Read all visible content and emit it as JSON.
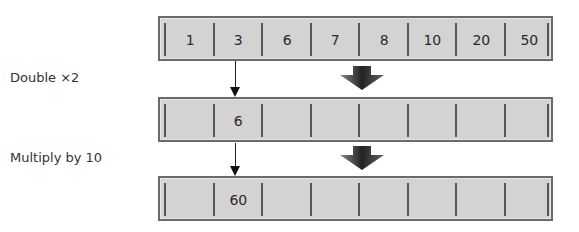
{
  "diagram": {
    "rows": [
      {
        "label": "",
        "cells": [
          "1",
          "3",
          "6",
          "7",
          "8",
          "10",
          "20",
          "50"
        ]
      },
      {
        "label": "Double ×2",
        "cells": [
          "",
          "6",
          "",
          "",
          "",
          "",
          "",
          ""
        ]
      },
      {
        "label": "Multiply by 10",
        "cells": [
          "",
          "60",
          "",
          "",
          "",
          "",
          "",
          ""
        ]
      }
    ],
    "steps": [
      {
        "label": "Double ×2",
        "from_cell_index": 1,
        "result": "6"
      },
      {
        "label": "Multiply by 10",
        "from_cell_index": 1,
        "result": "60"
      }
    ],
    "colors": {
      "cell_fill": "#d3d3d3",
      "border": "#6a6a6a",
      "arrow": "#333333"
    }
  }
}
